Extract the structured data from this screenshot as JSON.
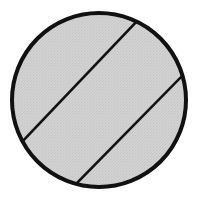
{
  "figure": {
    "background_color": "#ffffff",
    "canvas": {
      "width": 205,
      "height": 199
    }
  },
  "chart_data": {
    "type": "diagram",
    "subtitle": "",
    "xlabel": "",
    "ylabel": "",
    "grid": false,
    "legend_position": "none",
    "xlim": [
      0,
      205
    ],
    "ylim": [
      0,
      199
    ],
    "shapes": [
      {
        "name": "outer-circle",
        "type": "circle",
        "cx": 99,
        "cy": 100,
        "r": 89,
        "fill": "#d2d2d2",
        "stroke": "#111111",
        "stroke_width": 4
      },
      {
        "name": "upper-chord",
        "type": "line",
        "x1": 21,
        "y1": 143,
        "x2": 139,
        "y2": 19,
        "stroke": "#111111",
        "stroke_width": 2.6,
        "slope": -1.05
      },
      {
        "name": "lower-chord",
        "type": "line",
        "x1": 72,
        "y1": 188,
        "x2": 186,
        "y2": 72,
        "stroke": "#111111",
        "stroke_width": 2.6,
        "slope": -1.02
      }
    ],
    "regions": [
      {
        "name": "upper-left-segment",
        "fill": "#d2d2d2",
        "label": ""
      },
      {
        "name": "middle-band",
        "fill": "#d2d2d2",
        "label": ""
      },
      {
        "name": "lower-right-segment",
        "fill": "#d2d2d2",
        "label": ""
      }
    ],
    "texture": {
      "name": "halftone-dither",
      "base_color": "#d2d2d2",
      "dot_color": "#c2c2c2",
      "spacing": 3
    },
    "annotations": [],
    "labels": []
  }
}
